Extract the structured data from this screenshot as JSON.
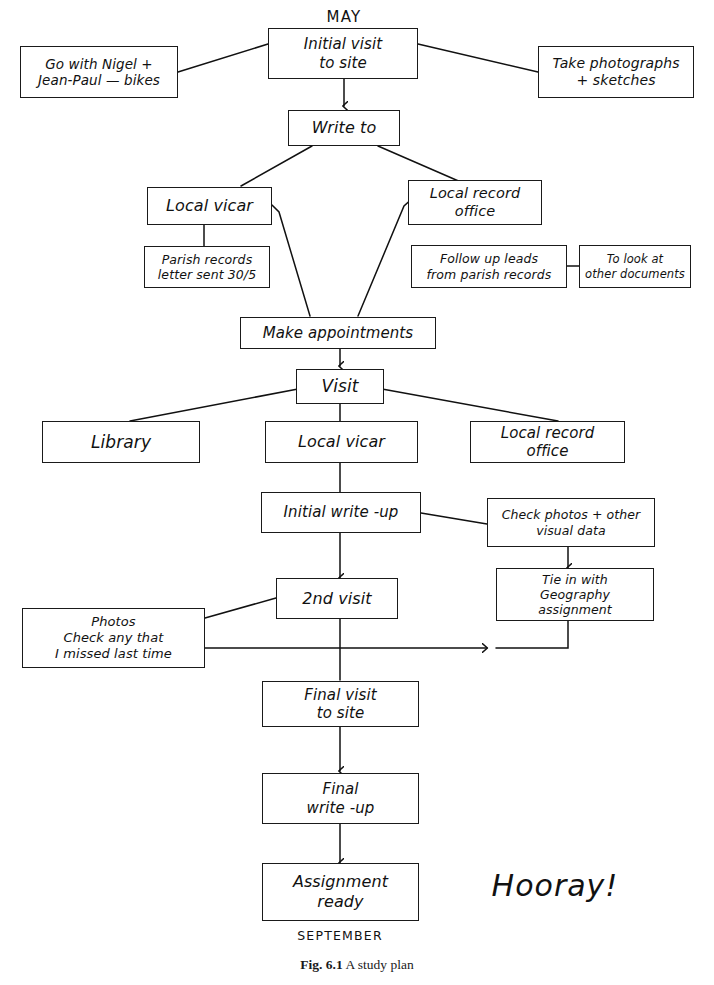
{
  "figure": {
    "number": "Fig. 6.1",
    "title": "A study plan"
  },
  "annotations": {
    "start_month": "MAY",
    "end_month": "SEPTEMBER",
    "celebration": "Hooray!"
  },
  "nodes": {
    "go_with": "Go with Nigel +\nJean-Paul — bikes",
    "initial_visit": "Initial visit\nto site",
    "take_photographs": "Take photographs\n+ sketches",
    "write_to": "Write to",
    "local_vicar_write": "Local vicar",
    "local_record_office_write": "Local record\noffice",
    "parish_records": "Parish records\nletter sent 30/5",
    "follow_up_leads": "Follow up leads\nfrom parish records",
    "other_documents": "To look at\nother documents",
    "make_appointments": "Make appointments",
    "visit": "Visit",
    "library": "Library",
    "local_vicar_visit": "Local vicar",
    "local_record_office_visit": "Local record\noffice",
    "initial_write_up": "Initial write -up",
    "check_photos": "Check photos + other\nvisual data",
    "second_visit": "2nd visit",
    "tie_in_geography": "Tie in with\nGeography\nassignment",
    "photos_check": "Photos\nCheck any that\nI missed last time",
    "final_visit": "Final visit\nto site",
    "final_write_up": "Final\nwrite -up",
    "assignment_ready": "Assignment\nready"
  },
  "colors": {
    "ink": "#111111",
    "paper": "#ffffff"
  }
}
